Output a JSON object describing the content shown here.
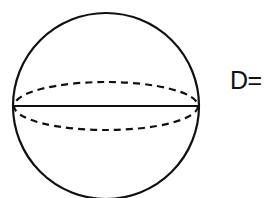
{
  "diagram": {
    "type": "sphere",
    "label": "D=",
    "stroke_color": "#111111",
    "background": "#ffffff",
    "sphere": {
      "cx": 106,
      "cy": 106,
      "r": 93
    },
    "equator": {
      "rx": 93,
      "ry": 24
    }
  }
}
